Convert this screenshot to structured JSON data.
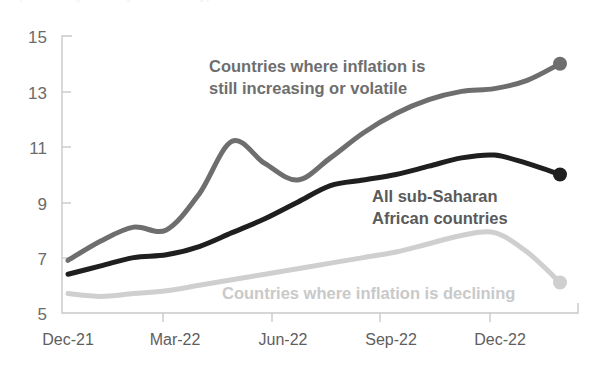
{
  "title_clipped": "(Percent, year-on-year, monthly)",
  "chart_data": {
    "type": "line",
    "title": "",
    "xlabel": "",
    "ylabel": "",
    "ylim": [
      5,
      15
    ],
    "yticks": [
      5,
      7,
      9,
      11,
      13,
      15
    ],
    "ytick_labels": [
      "5",
      "7",
      "9",
      "11",
      "13",
      "15"
    ],
    "grid": false,
    "legend_position": "inline-annotations",
    "categories": [
      "Dec-21",
      "Jan-22",
      "Feb-22",
      "Mar-22",
      "Apr-22",
      "May-22",
      "Jun-22",
      "Jul-22",
      "Aug-22",
      "Sep-22",
      "Oct-22",
      "Nov-22",
      "Dec-22",
      "Jan-23",
      "Feb-23",
      "Mar-23"
    ],
    "xtick_labels": [
      "Dec-21",
      "Mar-22",
      "Jun-22",
      "Sep-22",
      "Dec-22"
    ],
    "series": [
      {
        "name": "Countries where inflation is still increasing or volatile",
        "color": "#6e6e6e",
        "end_marker": true,
        "values": [
          6.9,
          7.6,
          8.1,
          8.0,
          9.3,
          11.2,
          10.4,
          9.8,
          10.6,
          11.5,
          12.2,
          12.7,
          13.0,
          13.1,
          13.4,
          14.0
        ]
      },
      {
        "name": "All sub-Saharan African countries",
        "color": "#1f1f1f",
        "end_marker": true,
        "values": [
          6.4,
          6.7,
          7.0,
          7.1,
          7.4,
          7.9,
          8.4,
          9.0,
          9.6,
          9.8,
          10.0,
          10.3,
          10.6,
          10.7,
          10.4,
          10.0
        ]
      },
      {
        "name": "Countries where inflation is declining",
        "color": "#cfcfcf",
        "end_marker": true,
        "values": [
          5.7,
          5.6,
          5.7,
          5.8,
          6.0,
          6.2,
          6.4,
          6.6,
          6.8,
          7.0,
          7.2,
          7.5,
          7.8,
          7.9,
          7.2,
          6.1
        ]
      }
    ],
    "annotations": [
      {
        "id": "annotation-increasing",
        "lines": [
          "Countries where inflation is",
          "still increasing or volatile"
        ],
        "color": "#6e6e6e"
      },
      {
        "id": "annotation-all-ssa",
        "lines": [
          "All sub-Saharan",
          "African countries"
        ],
        "color": "#5a5a5a"
      },
      {
        "id": "annotation-declining",
        "lines": [
          "Countries where inflation is declining"
        ],
        "color": "#c9c9c9"
      }
    ]
  }
}
